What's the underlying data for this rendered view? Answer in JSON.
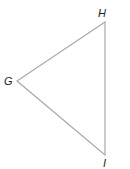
{
  "diagram": {
    "type": "triangle",
    "stroke_color": "#a8a8a8",
    "label_color": "#222222",
    "vertices": [
      {
        "name": "H",
        "x": 105,
        "y": 22,
        "label_x": 98,
        "label_y": 17
      },
      {
        "name": "G",
        "x": 17,
        "y": 81,
        "label_x": 4,
        "label_y": 85
      },
      {
        "name": "I",
        "x": 105,
        "y": 155,
        "label_x": 103,
        "label_y": 167
      }
    ],
    "labels": {
      "H": "H",
      "G": "G",
      "I": "I"
    }
  }
}
